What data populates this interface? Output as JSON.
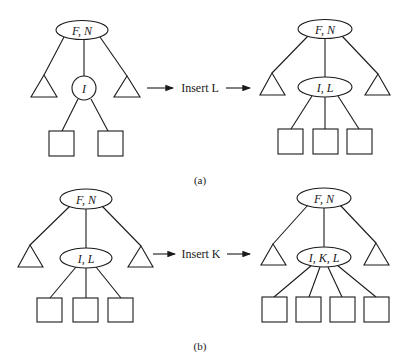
{
  "figure": {
    "panels": [
      {
        "id": "a",
        "caption": "(a)",
        "operation": "Insert L",
        "before": {
          "root": "F, N",
          "child": "I",
          "leaf_count": 2
        },
        "after": {
          "root": "F, N",
          "child": "I, L",
          "leaf_count": 3
        }
      },
      {
        "id": "b",
        "caption": "(b)",
        "operation": "Insert K",
        "before": {
          "root": "F, N",
          "child": "I, L",
          "leaf_count": 3
        },
        "after": {
          "root": "F, N",
          "child": "I, K, L",
          "leaf_count": 4
        }
      }
    ],
    "colors": {
      "ink": "#1a1a1a",
      "background": "#ffffff"
    }
  }
}
